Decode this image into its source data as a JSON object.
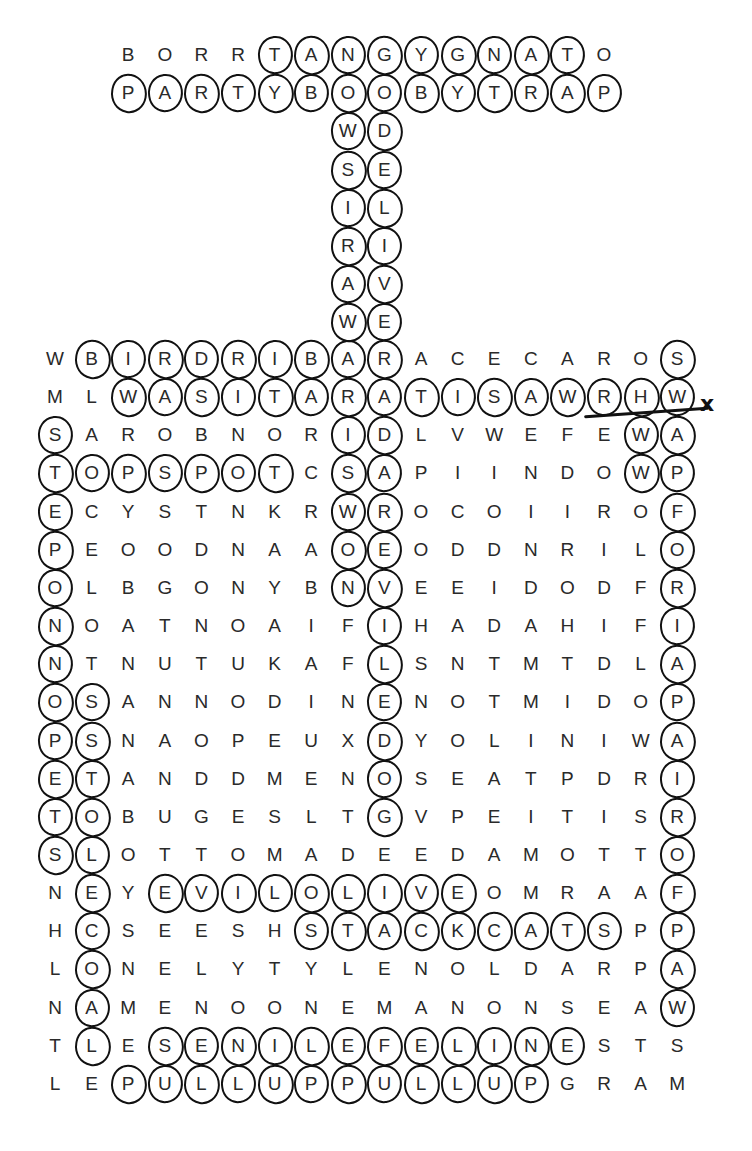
{
  "puzzle": {
    "type": "word-search",
    "columns": 18,
    "rows": [
      {
        "start_col": 2,
        "letters": "BORRTANGYGNATO"
      },
      {
        "start_col": 2,
        "letters": "PARTYBOOBYTRAP"
      },
      {
        "start_col": 8,
        "letters": "WD"
      },
      {
        "start_col": 8,
        "letters": "SE"
      },
      {
        "start_col": 8,
        "letters": "IL"
      },
      {
        "start_col": 8,
        "letters": "RI"
      },
      {
        "start_col": 8,
        "letters": "AV"
      },
      {
        "start_col": 8,
        "letters": "WE"
      },
      {
        "start_col": 0,
        "letters": "WBIRDRIBARACECAROS"
      },
      {
        "start_col": 0,
        "letters": "MLWASITARATISAWRHW"
      },
      {
        "start_col": 0,
        "letters": "SAROBNORIDLVWEFEWA"
      },
      {
        "start_col": 0,
        "letters": "TOPSPOTCSAPIINDOWP"
      },
      {
        "start_col": 0,
        "letters": "ECYSTNKRWROCOIIROF"
      },
      {
        "start_col": 0,
        "letters": "PEOODNAAOEODDNRILO"
      },
      {
        "start_col": 0,
        "letters": "OLBGONYBNVEEIDODFR"
      },
      {
        "start_col": 0,
        "letters": "NOATNOAIFIHADAHIFI"
      },
      {
        "start_col": 0,
        "letters": "NTNUTUKAFLSNTMTDLA"
      },
      {
        "start_col": 0,
        "letters": "OSANNODINENOTMIDOP"
      },
      {
        "start_col": 0,
        "letters": "PSNAOPEUXDYOLINIWA"
      },
      {
        "start_col": 0,
        "letters": "ETANDDMENOSEATPDRI"
      },
      {
        "start_col": 0,
        "letters": "TOBUGESLTGVPEITISR"
      },
      {
        "start_col": 0,
        "letters": "SLOTTOMADEEDAMOTTO"
      },
      {
        "start_col": 0,
        "letters": "NEYEVILOLIVEOMRAAF"
      },
      {
        "start_col": 0,
        "letters": "HCSEESHSTACKCATSPP"
      },
      {
        "start_col": 0,
        "letters": "LONELYTYLENOLDARPA"
      },
      {
        "start_col": 0,
        "letters": "NAMENOONEMANONSEAW"
      },
      {
        "start_col": 0,
        "letters": "TLESENILEFELINESTS"
      },
      {
        "start_col": 0,
        "letters": "LEPULLUPPULLUPGRAM"
      }
    ],
    "circled_words": [
      {
        "word": "TANGYGNAT",
        "cells": "row 0, cols 6-14",
        "row": 0,
        "col_from": 6,
        "col_to": 14,
        "dir": "h"
      },
      {
        "word": "PARTYBOOBYTRAP",
        "row": 1,
        "col_from": 2,
        "col_to": 15,
        "dir": "h"
      },
      {
        "word": "WASIRAW",
        "col": 8,
        "row_from": 2,
        "row_to": 8,
        "dir": "v"
      },
      {
        "word": "DELIVER",
        "col": 9,
        "row_from": 2,
        "row_to": 9,
        "dir": "v"
      },
      {
        "word": "BIRDRIBAR",
        "row": 8,
        "col_from": 1,
        "col_to": 9,
        "dir": "h"
      },
      {
        "word": "S",
        "row": 8,
        "col_from": 17,
        "col_to": 17,
        "dir": "h"
      },
      {
        "word": "WASITARATISAWRHW",
        "row": 9,
        "col_from": 2,
        "col_to": 17,
        "dir": "h",
        "struck": true
      },
      {
        "word": "STEPONNOPETS",
        "col": 0,
        "row_from": 10,
        "row_to": 21,
        "dir": "v"
      },
      {
        "word": "TOPSPOT",
        "row": 11,
        "col_from": 0,
        "col_to": 6,
        "dir": "h"
      },
      {
        "word": "ISWON",
        "col": 8,
        "row_from": 10,
        "row_to": 14,
        "dir": "v"
      },
      {
        "word": "DAREVILEDOG",
        "col": 9,
        "row_from": 10,
        "row_to": 20,
        "dir": "v"
      },
      {
        "word": "WW",
        "col": 16,
        "row_from": 10,
        "row_to": 11,
        "dir": "v"
      },
      {
        "word": "SWAPFORIAPAIROFPAW",
        "col": 17,
        "row_from": 8,
        "row_to": 25,
        "dir": "v"
      },
      {
        "word": "SSTOLECOAL",
        "col": 1,
        "row_from": 17,
        "row_to": 26,
        "dir": "v"
      },
      {
        "word": "EVILOLIVE",
        "row": 22,
        "col_from": 3,
        "col_to": 11,
        "dir": "h"
      },
      {
        "word": "STACKCATS",
        "row": 23,
        "col_from": 7,
        "col_to": 15,
        "dir": "h"
      },
      {
        "word": "SENILEFELINE",
        "row": 26,
        "col_from": 3,
        "col_to": 14,
        "dir": "h"
      },
      {
        "word": "PULLUPPULLUP",
        "row": 27,
        "col_from": 2,
        "col_to": 13,
        "dir": "h"
      }
    ],
    "annotations": {
      "strike_mark": "x"
    }
  }
}
